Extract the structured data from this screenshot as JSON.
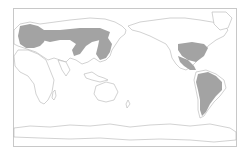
{
  "map": {
    "type": "distribution-range-map",
    "projection": "pacific-centered world",
    "colors": {
      "background": "#ffffff",
      "frame": "#c8c8c8",
      "coastline": "#b4b4b4",
      "range_fill": "#a3a3a3",
      "land_fill": "#ffffff"
    },
    "shaded_regions": [
      "Europe",
      "Northern and central Asia band",
      "Eastern China / Korea / Japan",
      "Eastern and central United States",
      "Mexico and Central America",
      "South America"
    ]
  }
}
